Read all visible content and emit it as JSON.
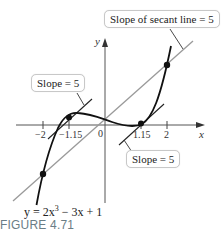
{
  "figure": {
    "caption": "FIGURE 4.71",
    "equation": {
      "prefix": "y = 2x",
      "exponent": "3",
      "suffix": " − 3x + 1"
    },
    "axes": {
      "x_label": "x",
      "y_label": "y"
    },
    "ticks": [
      {
        "label": "−2",
        "value": -2
      },
      {
        "label": "−1.15",
        "value": -1.15
      },
      {
        "label": "0",
        "value": 0
      },
      {
        "label": "1.15",
        "value": 1.15
      },
      {
        "label": "2",
        "value": 2
      }
    ],
    "callouts": {
      "secant": "Slope of secant line = 5",
      "tangent_left": "Slope = 5",
      "tangent_right": "Slope = 5"
    },
    "points": [
      {
        "x": -2,
        "y": -9,
        "role": "secant-endpoint"
      },
      {
        "x": 2,
        "y": 11,
        "role": "secant-endpoint"
      },
      {
        "x": -1.15,
        "y": 1.41,
        "role": "tangent-point"
      },
      {
        "x": 1.15,
        "y": 0.59,
        "role": "tangent-point"
      }
    ],
    "colors": {
      "curve": "#111111",
      "secant": "#9a9a9a",
      "axis": "#555555",
      "caption": "#6a7d86"
    }
  }
}
